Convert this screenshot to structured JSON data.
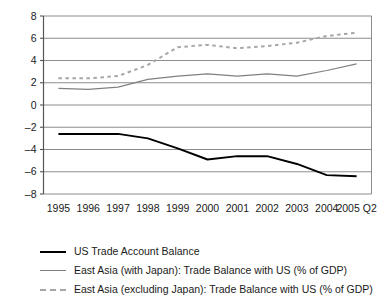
{
  "chart_data": {
    "type": "line",
    "title": "",
    "xlabel": "",
    "ylabel": "",
    "grid": true,
    "legend_position": "bottom-left",
    "ylim": [
      -8,
      8
    ],
    "yticks": [
      8,
      6,
      4,
      2,
      0,
      -2,
      -4,
      -6,
      -8
    ],
    "categories": [
      "1995",
      "1996",
      "1997",
      "1998",
      "1999",
      "2000",
      "2001",
      "2002",
      "2003",
      "2004",
      "2005 Q2"
    ],
    "series": [
      {
        "name": "US Trade Account Balance",
        "style": "solid",
        "color": "#000000",
        "values": [
          -2.6,
          -2.6,
          -2.6,
          -3.0,
          -3.9,
          -4.9,
          -4.6,
          -4.6,
          -5.3,
          -6.3,
          -6.4
        ]
      },
      {
        "name": "East Asia (with Japan): Trade Balance with US (% of GDP)",
        "style": "solid",
        "color": "#808080",
        "values": [
          1.5,
          1.4,
          1.6,
          2.3,
          2.6,
          2.8,
          2.6,
          2.8,
          2.6,
          3.1,
          3.7
        ]
      },
      {
        "name": "East Asia (excluding Japan): Trade Balance with US (% of GDP)",
        "style": "dashed",
        "color": "#a6a6a6",
        "values": [
          2.4,
          2.4,
          2.6,
          3.6,
          5.2,
          5.4,
          5.1,
          5.3,
          5.6,
          6.2,
          6.5
        ]
      }
    ]
  },
  "legend": {
    "items": [
      {
        "label": "US Trade Account Balance"
      },
      {
        "label": "East Asia (with Japan): Trade Balance with US (% of GDP)"
      },
      {
        "label": "East Asia (excluding Japan): Trade Balance with US (% of GDP)"
      }
    ]
  }
}
